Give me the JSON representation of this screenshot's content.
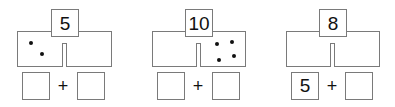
{
  "panels": [
    {
      "total": "5",
      "left_dots": 2,
      "right_dots": 0,
      "answer_left": "",
      "answer_right": "",
      "operator": "+"
    },
    {
      "total": "10",
      "left_dots": 0,
      "right_dots": 4,
      "answer_left": "",
      "answer_right": "",
      "operator": "+"
    },
    {
      "total": "8",
      "left_dots": 0,
      "right_dots": 0,
      "answer_left": "5",
      "answer_right": "",
      "operator": "+"
    }
  ]
}
